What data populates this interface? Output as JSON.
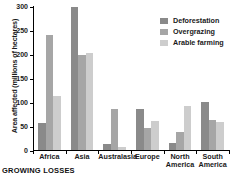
{
  "chart_data": {
    "type": "bar",
    "title": "",
    "xlabel": "",
    "ylabel": "Area affected (millions of hectares)",
    "ylim": [
      0,
      300
    ],
    "yticks": [
      0,
      50,
      100,
      150,
      200,
      250,
      300
    ],
    "ytick_labels": [
      "0",
      "50",
      "100",
      "150",
      "200",
      "250",
      "300"
    ],
    "grid": false,
    "legend_position": "top-right",
    "categories": [
      "Africa",
      "Asia",
      "Australasia",
      "Europe",
      "North\nAmerica",
      "South\nAmerica"
    ],
    "series": [
      {
        "name": "Deforestation",
        "color": "#8a8a8a",
        "values": [
          57,
          298,
          12,
          85,
          15,
          100
        ]
      },
      {
        "name": "Overgrazing",
        "color": "#a6a6a6",
        "values": [
          240,
          197,
          85,
          45,
          38,
          63
        ]
      },
      {
        "name": "Arable farming",
        "color": "#cdcdcd",
        "values": [
          112,
          202,
          7,
          60,
          91,
          58
        ]
      }
    ]
  },
  "caption": "GROWING LOSSES"
}
